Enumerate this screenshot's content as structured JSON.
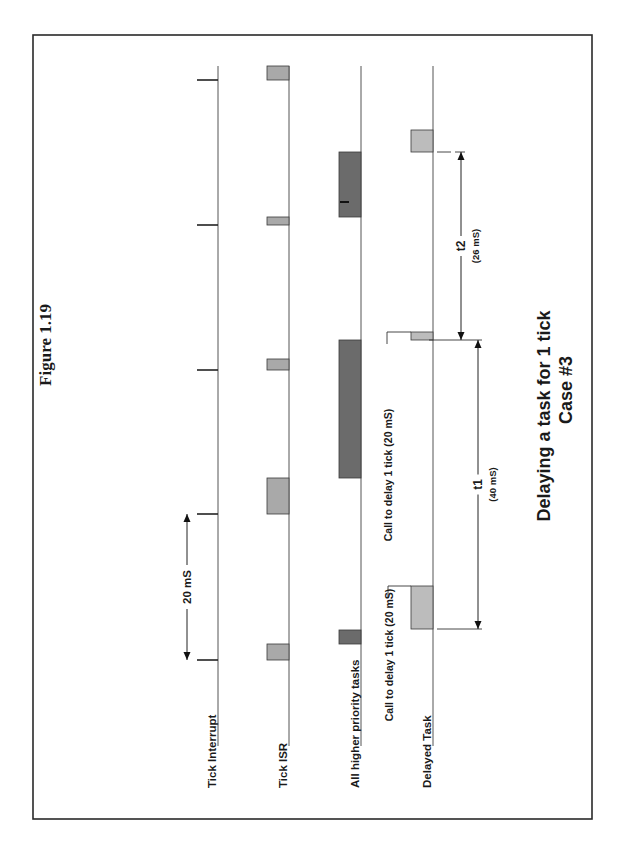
{
  "figure": {
    "label": "Figure 1.19",
    "title_line1": "Delaying a task for 1 tick",
    "title_line2": "Case #3"
  },
  "colors": {
    "frame": "#2a2a2a",
    "isr_fill": "#a9a9a9",
    "higher_priority_fill": "#6b6b6b",
    "delayed_task_fill": "#bcbcbc",
    "line": "#555555"
  },
  "tracks": [
    {
      "id": "tick-interrupt",
      "label": "Tick Interrupt",
      "x": 218
    },
    {
      "id": "tick-isr",
      "label": "Tick ISR",
      "x": 289
    },
    {
      "id": "higher-priority",
      "label": "All higher priority tasks",
      "x": 361
    },
    {
      "id": "delayed-task",
      "label": "Delayed Task",
      "x": 433
    }
  ],
  "track_range": {
    "y_top": 66,
    "y_bottom": 746
  },
  "ticks": [
    80,
    225,
    370,
    514,
    660
  ],
  "boxes": [
    {
      "track": "tick-isr",
      "y1": 66,
      "y2": 80,
      "color": "isr_fill"
    },
    {
      "track": "tick-isr",
      "y1": 217,
      "y2": 225,
      "color": "isr_fill"
    },
    {
      "track": "tick-isr",
      "y1": 359,
      "y2": 370,
      "color": "isr_fill"
    },
    {
      "track": "tick-isr",
      "y1": 478,
      "y2": 514,
      "color": "isr_fill"
    },
    {
      "track": "tick-isr",
      "y1": 644,
      "y2": 660,
      "color": "isr_fill"
    },
    {
      "track": "higher-priority",
      "y1": 152,
      "y2": 217,
      "color": "higher_priority_fill"
    },
    {
      "track": "higher-priority",
      "y1": 340,
      "y2": 478,
      "color": "higher_priority_fill"
    },
    {
      "track": "higher-priority",
      "y1": 630,
      "y2": 644,
      "color": "higher_priority_fill"
    },
    {
      "track": "delayed-task",
      "y1": 130,
      "y2": 152,
      "color": "delayed_task_fill"
    },
    {
      "track": "delayed-task",
      "y1": 332,
      "y2": 340,
      "color": "delayed_task_fill"
    },
    {
      "track": "delayed-task",
      "y1": 586,
      "y2": 629,
      "color": "delayed_task_fill"
    }
  ],
  "annotations": {
    "period": {
      "label": "20 mS",
      "x": 187,
      "y1": 514,
      "y2": 660
    },
    "call_delay_1": {
      "label": "Call to delay 1 tick (20 mS)",
      "bracket_y": 332,
      "text_x": 390,
      "text_y_center": 475
    },
    "call_delay_2": {
      "label": "Call to delay 1 tick (20 mS)",
      "bracket_y": 586,
      "text_x": 391,
      "text_y_center": 655
    },
    "t1": {
      "label": "t1",
      "value": "(40 mS)",
      "x": 478,
      "y1": 340,
      "y2": 629
    },
    "t2": {
      "label": "t2",
      "value": "(26 mS)",
      "x": 461,
      "y1": 152,
      "y2": 340
    }
  }
}
